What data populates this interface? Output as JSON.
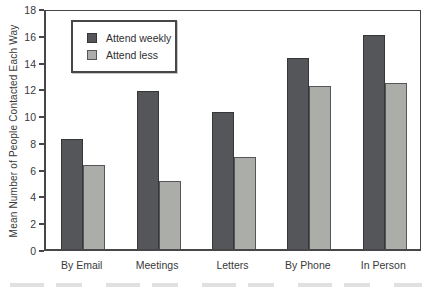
{
  "figure": {
    "background": "#ffffff",
    "axis_color": "#47474a",
    "text_color": "#39393b"
  },
  "chart_data": {
    "type": "bar",
    "title": "",
    "categories": [
      "By Email",
      "Meetings",
      "Letters",
      "By Phone",
      "In Person"
    ],
    "series": [
      {
        "name": "Attend weekly",
        "values": [
          8.2,
          11.8,
          10.2,
          14.3,
          16.0
        ],
        "color": "#55565a",
        "border": "#37373a"
      },
      {
        "name": "Attend less",
        "values": [
          6.3,
          5.1,
          6.9,
          12.2,
          12.4
        ],
        "color": "#abada9",
        "border": "#55565a"
      }
    ],
    "xlabel": "",
    "ylabel": "Mean Number of People Contacted Each Way",
    "ylim": [
      0,
      18
    ],
    "yticks": [
      0,
      2,
      4,
      6,
      8,
      10,
      12,
      14,
      16,
      18
    ],
    "grid": false,
    "legend_position": "top-left-inside",
    "legend_labels": [
      "Attend weekly",
      "Attend less"
    ]
  }
}
